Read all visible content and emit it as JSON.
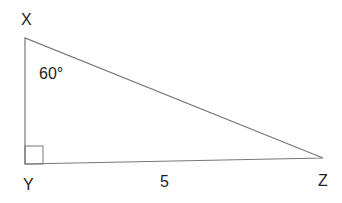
{
  "diagram": {
    "type": "right-triangle",
    "vertices": {
      "X": {
        "label": "X"
      },
      "Y": {
        "label": "Y"
      },
      "Z": {
        "label": "Z"
      }
    },
    "angle_label": "60°",
    "angle_at": "X",
    "right_angle_at": "Y",
    "side_label": "5",
    "side_labeled": "YZ",
    "colors": {
      "stroke": "#777777",
      "text": "#222222",
      "background": "#ffffff"
    }
  }
}
